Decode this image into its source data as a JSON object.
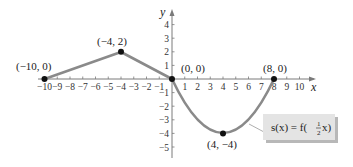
{
  "figure": {
    "axes": {
      "x_label": "x",
      "y_label": "y",
      "x_ticks": [
        "-10",
        "-9",
        "-8",
        "-7",
        "-6",
        "-5",
        "-4",
        "-3",
        "-2",
        "-1",
        "1",
        "2",
        "3",
        "4",
        "5",
        "6",
        "7",
        "8",
        "9",
        "10"
      ],
      "x_tick_values": [
        -10,
        -9,
        -8,
        -7,
        -6,
        -5,
        -4,
        -3,
        -2,
        -1,
        1,
        2,
        3,
        4,
        5,
        6,
        7,
        8,
        9,
        10
      ],
      "y_ticks": [
        "4",
        "3",
        "2",
        "1",
        "-1",
        "-2",
        "-3",
        "-4",
        "-5"
      ],
      "y_tick_values": [
        4,
        3,
        2,
        1,
        -1,
        -2,
        -3,
        -4,
        -5
      ],
      "xlim": [
        -10.5,
        11
      ],
      "ylim": [
        -6,
        5
      ]
    },
    "points": [
      {
        "label": "(−10, 0)",
        "x": -10,
        "y": 0
      },
      {
        "label": "(−4, 2)",
        "x": -4,
        "y": 2
      },
      {
        "label": "(0, 0)",
        "x": 0,
        "y": 0
      },
      {
        "label": "(4, −4)",
        "x": 4,
        "y": -4
      },
      {
        "label": "(8, 0)",
        "x": 8,
        "y": 0
      }
    ],
    "legend": {
      "prefix": "s(x) = f(",
      "frac_num": "1",
      "frac_den": "2",
      "suffix": "x)"
    },
    "colors": {
      "curve": "#8a8a8a",
      "axis": "#7a7a7a",
      "point": "#111111",
      "legend_fill": "#e4e4e4",
      "legend_shadow": "#b8b8b8"
    }
  }
}
